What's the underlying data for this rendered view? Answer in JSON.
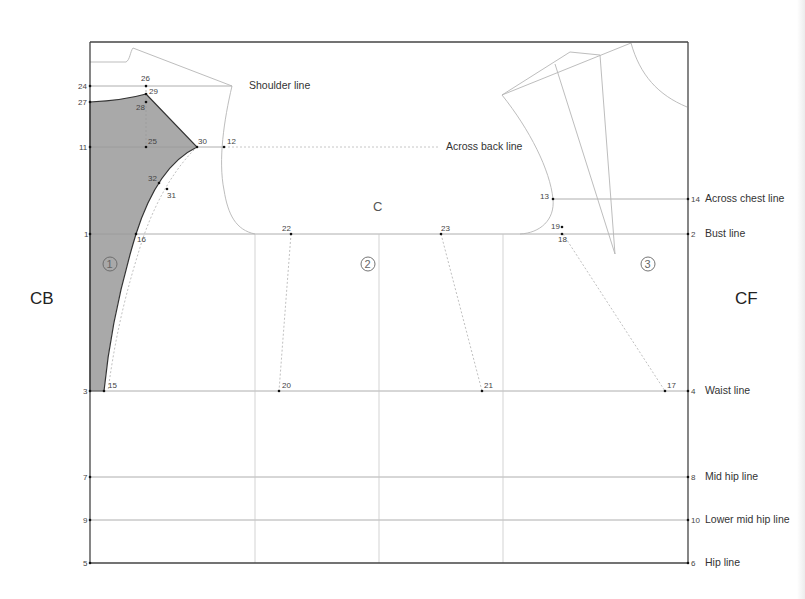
{
  "diagram": {
    "side_labels": {
      "left": "CB",
      "right": "CF"
    },
    "center_label": "C",
    "pieces": [
      "1",
      "2",
      "3"
    ],
    "left_row_numbers": {
      "shoulder": "24",
      "neck": "27",
      "across_back": "11",
      "bust": "1",
      "waist": "3",
      "mid_hip": "7",
      "lower_mid_hip": "9",
      "hip": "5"
    },
    "right_row_numbers": {
      "across_chest": "14",
      "bust": "2",
      "waist": "4",
      "mid_hip": "8",
      "lower_mid_hip": "10",
      "hip": "6"
    },
    "line_labels": {
      "shoulder": "Shoulder line",
      "across_back": "Across back line",
      "across_chest": "Across chest line",
      "bust": "Bust line",
      "waist": "Waist line",
      "mid_hip": "Mid hip line",
      "lower_mid_hip": "Lower mid hip line",
      "hip": "Hip line"
    },
    "points": {
      "p12": "12",
      "p13": "13",
      "p15": "15",
      "p16": "16",
      "p17": "17",
      "p18": "18",
      "p19": "19",
      "p20": "20",
      "p21": "21",
      "p22": "22",
      "p23": "23",
      "p25": "25",
      "p26": "26",
      "p28": "28",
      "p29": "29",
      "p30": "30",
      "p31": "31",
      "p32": "32"
    },
    "colors": {
      "frame": "#444444",
      "guide": "#c8c8c8",
      "shaded_piece": "#a9a9a9",
      "dotted": "#b0b0b0"
    }
  }
}
